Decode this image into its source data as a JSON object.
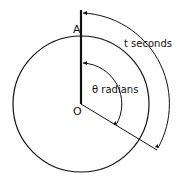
{
  "diagram": {
    "labels": {
      "point_a": "A",
      "origin": "O",
      "angle": "θ radians",
      "time": "t seconds"
    },
    "colors": {
      "stroke": "#111111",
      "background": "#ffffff"
    }
  }
}
